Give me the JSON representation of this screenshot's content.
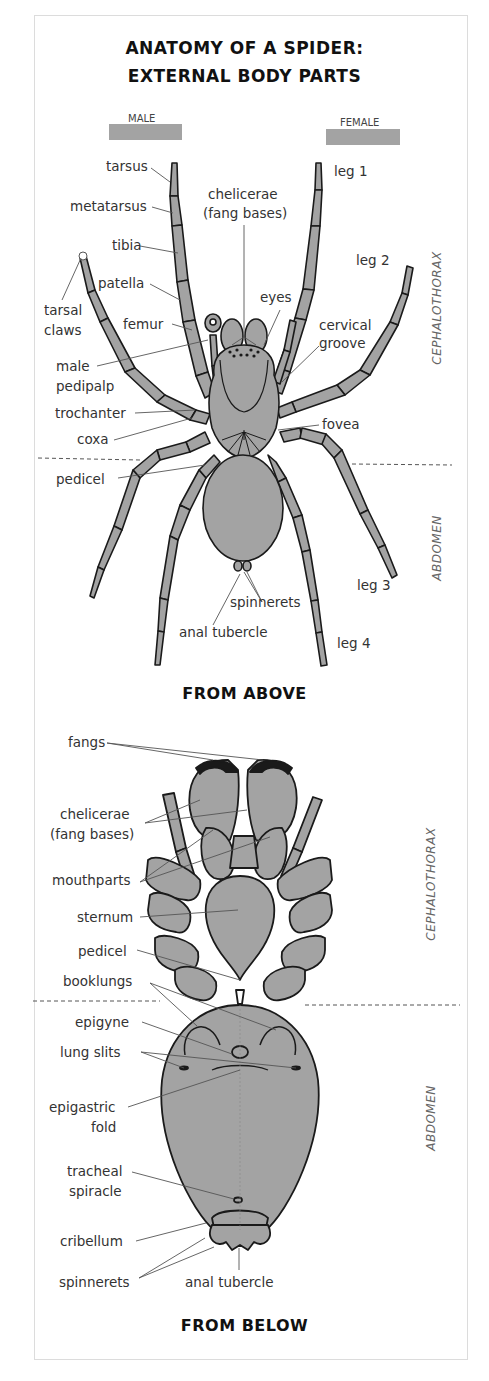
{
  "title": {
    "line1": "ANATOMY OF A SPIDER:",
    "line2": "EXTERNAL BODY PARTS"
  },
  "legend": {
    "male": {
      "label": "MALE",
      "color": "#a3a3a3"
    },
    "female": {
      "label": "FEMALE",
      "color": "#a3a3a3"
    }
  },
  "colors": {
    "body_fill": "#a3a3a3",
    "outline": "#1a1a1a",
    "leader": "#555555",
    "frame": "#dcdcdc"
  },
  "top_view": {
    "caption": "FROM ABOVE",
    "regions": {
      "cephalothorax": "CEPHALOTHORAX",
      "abdomen": "ABDOMEN"
    },
    "labels": {
      "tarsus": "tarsus",
      "metatarsus": "metatarsus",
      "tibia": "tibia",
      "patella": "patella",
      "tarsal_claws_1": "tarsal",
      "tarsal_claws_2": "claws",
      "femur": "femur",
      "male_pedipalp_1": "male",
      "male_pedipalp_2": "pedipalp",
      "trochanter": "trochanter",
      "coxa": "coxa",
      "pedicel": "pedicel",
      "chelicerae_1": "chelicerae",
      "chelicerae_2": "(fang bases)",
      "eyes": "eyes",
      "cervical_groove_1": "cervical",
      "cervical_groove_2": "groove",
      "fovea": "fovea",
      "leg1": "leg 1",
      "leg2": "leg 2",
      "leg3": "leg 3",
      "leg4": "leg 4",
      "spinnerets": "spinnerets",
      "anal_tubercle": "anal tubercle"
    }
  },
  "bottom_view": {
    "caption": "FROM BELOW",
    "regions": {
      "cephalothorax": "CEPHALOTHORAX",
      "abdomen": "ABDOMEN"
    },
    "labels": {
      "fangs": "fangs",
      "chelicerae_1": "chelicerae",
      "chelicerae_2": "(fang bases)",
      "mouthparts": "mouthparts",
      "sternum": "sternum",
      "pedicel": "pedicel",
      "booklungs": "booklungs",
      "epigyne": "epigyne",
      "lung_slits": "lung slits",
      "epigastric_fold_1": "epigastric",
      "epigastric_fold_2": "fold",
      "tracheal_spiracle_1": "tracheal",
      "tracheal_spiracle_2": "spiracle",
      "cribellum": "cribellum",
      "spinnerets": "spinnerets",
      "anal_tubercle": "anal tubercle"
    }
  }
}
